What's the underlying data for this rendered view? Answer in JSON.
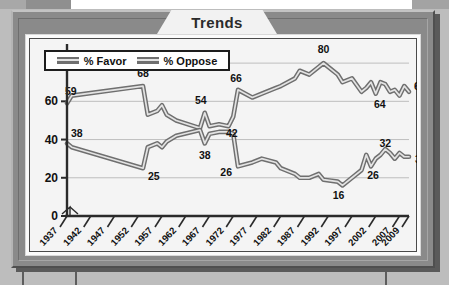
{
  "chart_title": "Trends",
  "legend": {
    "position": "top-left-inside",
    "items": [
      {
        "label": "% Favor",
        "swatch": "gray-ribbon-line"
      },
      {
        "label": "% Oppose",
        "swatch": "gray-ribbon-line"
      }
    ]
  },
  "icons": {
    "axis_break": "axis-break-zigzag-icon"
  },
  "colors": {
    "frame": "#8a8a8a",
    "frame_highlight": "#c3c3c3",
    "frame_shadow": "#4f4f4f",
    "card": "#fbfbfb",
    "plot_background": "#f4f4f4",
    "gridline": "#b8b8b8",
    "line_dark": "#6f6f6f",
    "line_light": "#e3e3e3",
    "text": "#111111",
    "title_tab": "#f2f2f2"
  },
  "chart_data": {
    "type": "line",
    "title": "Trends",
    "xlabel": "",
    "ylabel": "",
    "ylim": [
      0,
      90
    ],
    "yticks": [
      0,
      20,
      40,
      60,
      80
    ],
    "ytick_labels": [
      "0",
      "20",
      "40",
      "60",
      "80"
    ],
    "grid": true,
    "grid_axis": "y",
    "y_axis_break": true,
    "xtick_labels": [
      "1937",
      "1942",
      "1947",
      "1952",
      "1957",
      "1962",
      "1967",
      "1972",
      "1977",
      "1982",
      "1987",
      "1992",
      "1997",
      "2002",
      "2007",
      "2009"
    ],
    "x_start": 1937,
    "x_end": 2009,
    "series": [
      {
        "name": "% Favor",
        "x": [
          1937,
          1938,
          1953,
          1954,
          1956,
          1957,
          1958,
          1960,
          1965,
          1966,
          1967,
          1969,
          1971,
          1972,
          1973,
          1976,
          1978,
          1981,
          1982,
          1985,
          1986,
          1988,
          1990,
          1991,
          1994,
          1995,
          1997,
          1999,
          2000,
          2001,
          2002,
          2003,
          2004,
          2005,
          2006,
          2007,
          2008,
          2009
        ],
        "y": [
          59,
          63,
          68,
          53,
          55,
          58,
          53,
          50,
          46,
          54,
          47,
          48,
          47,
          52,
          66,
          62,
          64,
          67,
          68,
          72,
          76,
          74,
          78,
          80,
          74,
          70,
          72,
          65,
          67,
          70,
          64,
          70,
          69,
          65,
          66,
          63,
          68,
          65
        ]
      },
      {
        "name": "% Oppose",
        "x": [
          1937,
          1938,
          1953,
          1954,
          1956,
          1957,
          1958,
          1960,
          1965,
          1966,
          1967,
          1969,
          1971,
          1972,
          1973,
          1976,
          1978,
          1981,
          1982,
          1985,
          1986,
          1988,
          1990,
          1991,
          1994,
          1995,
          1997,
          1999,
          2000,
          2001,
          2002,
          2003,
          2004,
          2005,
          2006,
          2007,
          2008,
          2009
        ],
        "y": [
          38,
          36,
          25,
          36,
          38,
          36,
          39,
          42,
          45,
          38,
          43,
          44,
          44,
          43,
          26,
          28,
          30,
          28,
          25,
          22,
          20,
          20,
          22,
          19,
          18,
          16,
          20,
          24,
          32,
          26,
          30,
          32,
          35,
          33,
          30,
          33,
          31,
          31
        ]
      }
    ],
    "point_labels": [
      {
        "series": "% Favor",
        "x": 1937,
        "value": 59,
        "text": "59"
      },
      {
        "series": "% Favor",
        "x": 1953,
        "value": 68,
        "text": "68"
      },
      {
        "series": "% Favor",
        "x": 1966,
        "value": 54,
        "text": "54"
      },
      {
        "series": "% Favor",
        "x": 1973,
        "value": 66,
        "text": "66"
      },
      {
        "series": "% Favor",
        "x": 1991,
        "value": 80,
        "text": "80"
      },
      {
        "series": "% Favor",
        "x": 2002,
        "value": 64,
        "text": "64"
      },
      {
        "series": "% Favor",
        "x": 2009,
        "value": 65,
        "text": "65"
      },
      {
        "series": "% Oppose",
        "x": 1937,
        "value": 38,
        "text": "38"
      },
      {
        "series": "% Oppose",
        "x": 1953,
        "value": 25,
        "text": "25"
      },
      {
        "series": "% Oppose",
        "x": 1966,
        "value": 38,
        "text": "38"
      },
      {
        "series": "% Oppose",
        "x": 1969,
        "value": 42,
        "text": "42"
      },
      {
        "series": "% Oppose",
        "x": 1973,
        "value": 26,
        "text": "26"
      },
      {
        "series": "% Oppose",
        "x": 1995,
        "value": 16,
        "text": "16"
      },
      {
        "series": "% Oppose",
        "x": 2001,
        "value": 26,
        "text": "26"
      },
      {
        "series": "% Oppose",
        "x": 2004,
        "value": 32,
        "text": "32"
      },
      {
        "series": "% Oppose",
        "x": 2009,
        "value": 31,
        "text": "31"
      }
    ]
  }
}
